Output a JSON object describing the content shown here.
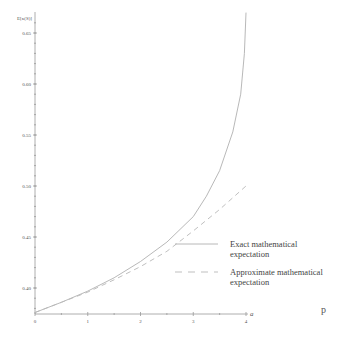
{
  "chart_data": {
    "type": "line",
    "title": "",
    "xlabel": "a",
    "ylabel": "E[κ(S)]",
    "xlim": [
      0,
      4
    ],
    "ylim": [
      0.375,
      0.67
    ],
    "x_ticks": [
      "0",
      "1",
      "2",
      "3",
      "4"
    ],
    "x_tick_values": [
      0,
      1,
      2,
      3,
      4
    ],
    "y_ticks": [
      "0.40",
      "0.45",
      "0.50",
      "0.55",
      "0.60",
      "0.65"
    ],
    "y_tick_values": [
      0.4,
      0.45,
      0.5,
      0.55,
      0.6,
      0.65
    ],
    "grid": false,
    "legend_position": "bottom-right",
    "series": [
      {
        "name": "Exact mathematical expectation",
        "legend_lines": [
          "Exact mathematical",
          "expectation"
        ],
        "style": "solid",
        "color": "#b0b0b0",
        "x": [
          0,
          0.5,
          1,
          1.5,
          2,
          2.5,
          3,
          3.25,
          3.5,
          3.75,
          3.9,
          3.97,
          4.0
        ],
        "y": [
          0.376,
          0.386,
          0.397,
          0.41,
          0.426,
          0.445,
          0.47,
          0.49,
          0.515,
          0.553,
          0.59,
          0.63,
          0.67
        ]
      },
      {
        "name": "Approximate mathematical expectation",
        "legend_lines": [
          "Approximate mathematical",
          "expectation"
        ],
        "style": "dashed",
        "color": "#b8b8b8",
        "x": [
          0,
          0.5,
          1,
          1.5,
          2,
          2.5,
          3,
          3.5,
          4
        ],
        "y": [
          0.376,
          0.386,
          0.396,
          0.408,
          0.421,
          0.436,
          0.456,
          0.477,
          0.5
        ]
      }
    ]
  },
  "caption_letter": "p"
}
